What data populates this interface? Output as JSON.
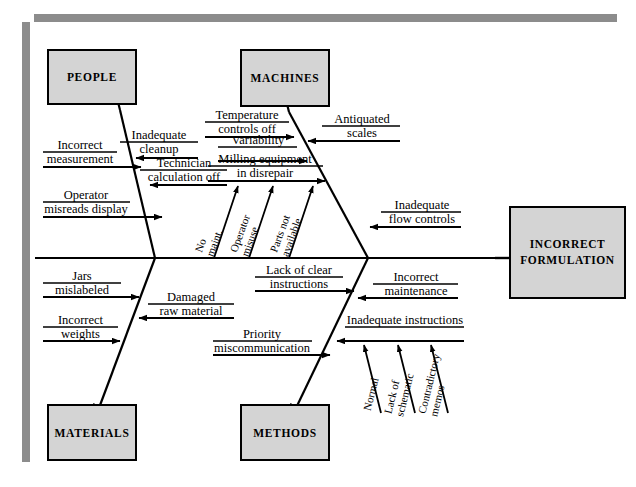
{
  "diagram": {
    "type": "fishbone-ishikawa",
    "effect": {
      "label_line1": "INCORRECT",
      "label_line2": "FORMULATION"
    },
    "colors": {
      "box_fill": "#d4d4d4",
      "box_border": "#000000",
      "frame": "#8c8c8c",
      "line": "#000000",
      "background": "#ffffff"
    },
    "categories": [
      {
        "name": "people",
        "label": "PEOPLE",
        "position": "upper-left",
        "causes": [
          {
            "id": "inadequate-cleanup",
            "line1": "Inadequate",
            "line2": "cleanup",
            "side": "right"
          },
          {
            "id": "incorrect-measurement",
            "line1": "Incorrect",
            "line2": "measurement",
            "side": "left"
          },
          {
            "id": "technician-calculation-off",
            "line1": "Technician",
            "line2": "calculation off",
            "side": "right"
          },
          {
            "id": "operator-misreads-display",
            "line1": "Operator",
            "line2": "misreads display",
            "side": "left"
          }
        ],
        "sub_causes": []
      },
      {
        "name": "machines",
        "label": "MACHINES",
        "position": "upper-right",
        "causes": [
          {
            "id": "temperature-controls-off",
            "line1": "Temperature",
            "line2": "controls off",
            "side": "left"
          },
          {
            "id": "antiquated-scales",
            "line1": "Antiquated",
            "line2": "scales",
            "side": "right"
          },
          {
            "id": "variability",
            "line1": "Variability",
            "line2": "",
            "side": "left"
          },
          {
            "id": "milling-equipment-in-disrepair",
            "line1": "Milling equipment",
            "line2": "in disrepair",
            "side": "left"
          },
          {
            "id": "inadequate-flow-controls",
            "line1": "Inadequate",
            "line2": "flow controls",
            "side": "right"
          }
        ],
        "sub_causes": [
          {
            "id": "no-maint",
            "line1": "No",
            "line2": "maint."
          },
          {
            "id": "operator-misuse",
            "line1": "Operator",
            "line2": "misuse"
          },
          {
            "id": "parts-not-available",
            "line1": "Parts not",
            "line2": "available"
          }
        ]
      },
      {
        "name": "materials",
        "label": "MATERIALS",
        "position": "lower-left",
        "causes": [
          {
            "id": "jars-mislabeled",
            "line1": "Jars",
            "line2": "mislabeled",
            "side": "left"
          },
          {
            "id": "damaged-raw-material",
            "line1": "Damaged",
            "line2": "raw material",
            "side": "right"
          },
          {
            "id": "incorrect-weights",
            "line1": "Incorrect",
            "line2": "weights",
            "side": "left"
          }
        ],
        "sub_causes": []
      },
      {
        "name": "methods",
        "label": "METHODS",
        "position": "lower-right",
        "causes": [
          {
            "id": "lack-of-clear-instructions",
            "line1": "Lack of clear",
            "line2": "instructions",
            "side": "left"
          },
          {
            "id": "incorrect-maintenance",
            "line1": "Incorrect",
            "line2": "maintenance",
            "side": "right"
          },
          {
            "id": "inadequate-instructions",
            "line1": "Inadequate instructions",
            "line2": "",
            "side": "right"
          },
          {
            "id": "priority-miscommunication",
            "line1": "Priority",
            "line2": "miscommunication",
            "side": "left"
          }
        ],
        "sub_causes": [
          {
            "id": "normal",
            "line1": "Normal",
            "line2": ""
          },
          {
            "id": "lack-of-schematic",
            "line1": "Lack of",
            "line2": "schematic"
          },
          {
            "id": "contradictory-memos",
            "line1": "Contradictory",
            "line2": "memos"
          }
        ]
      }
    ]
  }
}
